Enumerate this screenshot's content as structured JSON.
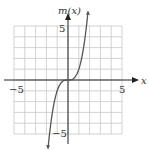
{
  "chart_data": {
    "type": "line",
    "title": "",
    "function": "m(x) = x^3",
    "xlabel": "x",
    "ylabel": "m(x)",
    "xlim": [
      -5,
      5
    ],
    "ylim": [
      -5,
      5
    ],
    "grid": true,
    "grid_step": 1,
    "tick_labels": {
      "x": [
        "-5",
        "5"
      ],
      "y": [
        "5",
        "-5"
      ]
    },
    "series": [
      {
        "name": "m(x)",
        "x": [
          -1.85,
          -1.5,
          -1.0,
          -0.5,
          0,
          0.5,
          1.0,
          1.5,
          1.85
        ],
        "values": [
          -6.33,
          -3.38,
          -1.0,
          -0.13,
          0,
          0.13,
          1.0,
          3.38,
          6.33
        ]
      }
    ]
  },
  "labels": {
    "x_axis": "x",
    "y_axis": "m(x)",
    "x_neg": "−5",
    "x_pos": "5",
    "y_pos": "5",
    "y_neg": "−5"
  },
  "colors": {
    "grid": "#c8c8c8",
    "axis": "#222222",
    "curve": "#555555"
  }
}
